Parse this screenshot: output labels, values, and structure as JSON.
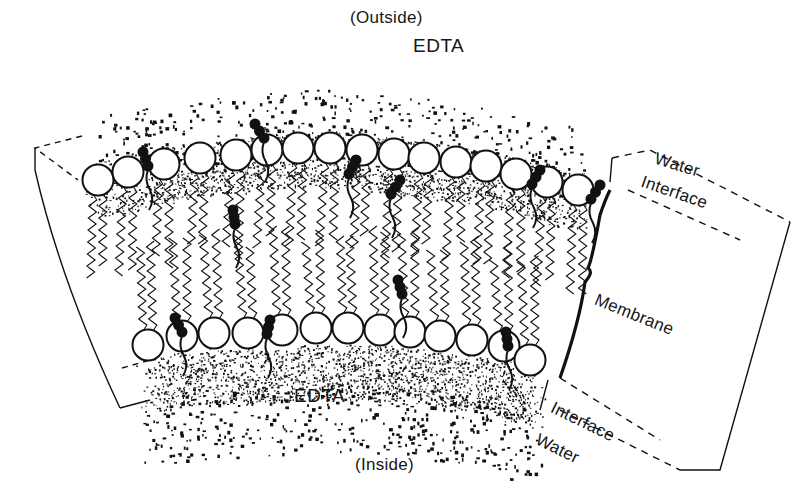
{
  "figure": {
    "title_outside": "(Outside)",
    "title_inside": "(Inside)",
    "edta_top": "EDTA",
    "edta_bottom": "EDTA",
    "legend": {
      "water_top": "Water",
      "interface_top": "Interface",
      "membrane": "Membrane",
      "interface_bottom": "Interface",
      "water_bottom": "Water"
    },
    "colors": {
      "ink": "#111111",
      "background": "#ffffff",
      "stipple": "#1a1a1a"
    },
    "layers": [
      "Water",
      "Interface",
      "Membrane",
      "Interface",
      "Water"
    ],
    "regions": [
      "Outside",
      "Inside"
    ],
    "components": {
      "phospholipid_heads_top": 15,
      "phospholipid_heads_bottom": 14,
      "embedded_molecules_dark": 9
    }
  }
}
